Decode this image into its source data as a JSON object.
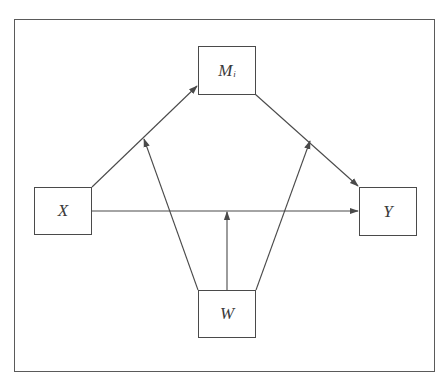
{
  "diagram": {
    "type": "moderated mediation model",
    "nodes": {
      "x": {
        "label": "X"
      },
      "m": {
        "label": "M",
        "subscript": "i"
      },
      "y": {
        "label": "Y"
      },
      "w": {
        "label": "W"
      }
    },
    "edges": [
      {
        "from": "X",
        "to": "M_i",
        "kind": "directed"
      },
      {
        "from": "M_i",
        "to": "Y",
        "kind": "directed"
      },
      {
        "from": "X",
        "to": "Y",
        "kind": "directed"
      },
      {
        "from": "W",
        "to": "X→M_i path",
        "kind": "moderation"
      },
      {
        "from": "W",
        "to": "M_i→Y path",
        "kind": "moderation"
      },
      {
        "from": "W",
        "to": "X→Y path",
        "kind": "moderation"
      }
    ],
    "colors": {
      "line": "#4a4a4a",
      "frame": "#5a5a5a",
      "text": "#3a3a3a",
      "background": "#ffffff"
    }
  }
}
